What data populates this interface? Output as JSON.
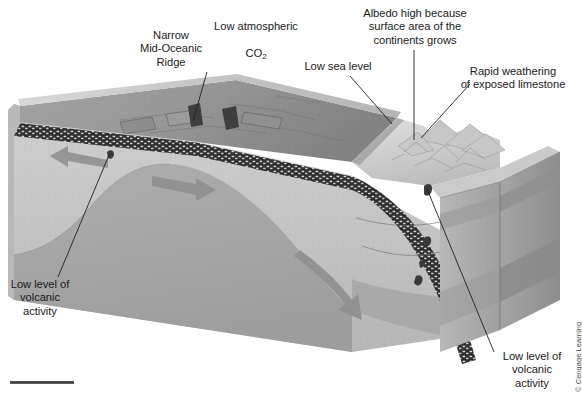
{
  "figure": {
    "background_color": "#ffffff",
    "width": 582,
    "height": 395
  },
  "labels": [
    {
      "name": "label-low-atmospheric-co2",
      "line1": "Low atmospheric",
      "line2": "CO",
      "subscript": "2",
      "x": 200,
      "y": 7,
      "width": 112,
      "leader": false
    },
    {
      "name": "label-narrow-mid-oceanic-ridge",
      "text": "Narrow\nMid-Oceanic\nRidge",
      "x": 133,
      "y": 29,
      "width": 76,
      "leader": true
    },
    {
      "name": "label-low-sea-level",
      "text": "Low sea level",
      "x": 295,
      "y": 60,
      "width": 86,
      "leader": true
    },
    {
      "name": "label-albedo-high",
      "text": "Albedo high because\nsurface area of the\ncontinents grows",
      "x": 355,
      "y": 7,
      "width": 120,
      "leader": true
    },
    {
      "name": "label-rapid-weathering",
      "text": "Rapid weathering\nof exposed limestone",
      "x": 449,
      "y": 65,
      "width": 128,
      "leader": true
    },
    {
      "name": "label-low-volcanic-activity-left",
      "text": "Low level of\nvolcanic\nactivity",
      "x": 3,
      "y": 278,
      "width": 74,
      "leader": true
    },
    {
      "name": "label-low-volcanic-activity-right",
      "text": "Low level of\nvolcanic\nactivity",
      "x": 495,
      "y": 350,
      "width": 74,
      "leader": true
    }
  ],
  "credit": {
    "text": "© Cengage Learning"
  },
  "colors": {
    "ocean_water": "#9a9a9a",
    "ocean_water_dark": "#868686",
    "sea_surface": "#c9c9c9",
    "oceanic_crust": "#2b2b2b",
    "mantle_light": "#c4c4c4",
    "mantle_mid": "#b0b0b0",
    "mantle_dark": "#9d9d9d",
    "continent_top": "#d2d2d2",
    "block_side": "#a8a8a8",
    "leader_line": "#222222",
    "arrow_fill": "#8e8e8e",
    "text": "#1b1b1b"
  },
  "scene_elements": [
    {
      "name": "ocean-basin",
      "description": "wide shallow ocean basin across left and center of block"
    },
    {
      "name": "mid-ocean-ridge",
      "description": "narrow spreading ridge with transform offsets near center-left"
    },
    {
      "name": "spreading-arrow-left",
      "description": "grey arrow pointing left away from ridge"
    },
    {
      "name": "spreading-arrow-right",
      "description": "grey arrow pointing right away from ridge"
    },
    {
      "name": "subducting-slab",
      "description": "dark speckled oceanic crust bending down to the right"
    },
    {
      "name": "mantle-flow-arrow",
      "description": "grey curved arrow descending in the mantle on the right"
    },
    {
      "name": "continent-mountains",
      "description": "exposed continental highland with eroded limestone ridges on the right"
    },
    {
      "name": "volcano-marker-left",
      "description": "small dark volcanic vent near the ridge"
    },
    {
      "name": "volcano-marker-right",
      "description": "small dark volcanic vents above the subduction zone"
    },
    {
      "name": "block-edge-bar",
      "description": "thin dark rule at lower-left page edge"
    }
  ]
}
